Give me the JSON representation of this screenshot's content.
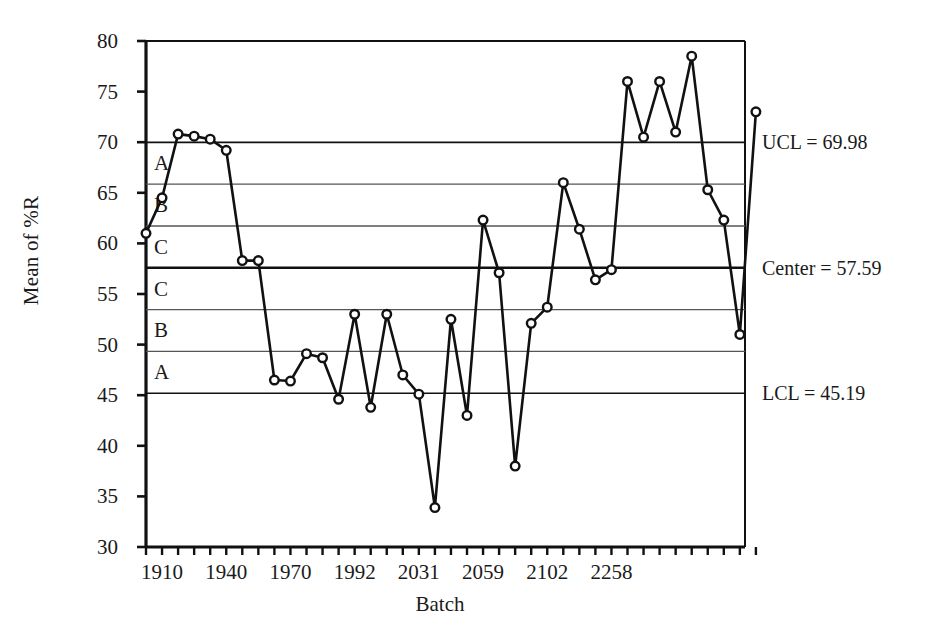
{
  "chart_data": {
    "type": "line",
    "title": "",
    "subtitle": "",
    "xlabel": "Batch",
    "ylabel": "Mean of %R",
    "ylim": [
      30,
      80
    ],
    "ytick_values": [
      30,
      35,
      40,
      45,
      50,
      55,
      60,
      65,
      70,
      75,
      80
    ],
    "ytick_labels": [
      "30",
      "35",
      "40",
      "45",
      "50",
      "55",
      "60",
      "65",
      "70",
      "75",
      "80"
    ],
    "grid": false,
    "legend": "none",
    "xtick_labels": [
      "1910",
      "1940",
      "1970",
      "1992",
      "2031",
      "2059",
      "2102",
      "2258"
    ],
    "xtick_indices": [
      1,
      5,
      9,
      13,
      17,
      21,
      25,
      29
    ],
    "n_points": 39,
    "x_index_range": [
      0,
      38
    ],
    "marker": "open-circle",
    "series": [
      {
        "name": "Mean of %R",
        "values": [
          61.0,
          64.5,
          70.8,
          70.6,
          70.3,
          69.2,
          58.3,
          58.3,
          46.5,
          46.4,
          49.1,
          48.7,
          44.6,
          53.0,
          43.8,
          53.0,
          47.0,
          45.1,
          33.9,
          52.5,
          43.0,
          62.3,
          57.1,
          38.0,
          52.1,
          53.7,
          66.0,
          61.4,
          56.4,
          57.4,
          76.0,
          70.5,
          76.0,
          71.0,
          78.5,
          65.3,
          62.3,
          51.0,
          73.0
        ]
      }
    ],
    "control_limits": {
      "ucl": 69.98,
      "center": 57.59,
      "lcl": 45.19,
      "ucl_label": "UCL = 69.98",
      "center_label": "Center = 57.59",
      "lcl_label": "LCL = 45.19",
      "sigma_lines": [
        65.85,
        61.72,
        53.46,
        49.33
      ]
    },
    "zones": [
      {
        "letter": "A",
        "value": 67.9
      },
      {
        "letter": "B",
        "value": 63.8
      },
      {
        "letter": "C",
        "value": 59.6
      },
      {
        "letter": "C",
        "value": 55.5
      },
      {
        "letter": "B",
        "value": 51.4
      },
      {
        "letter": "A",
        "value": 47.3
      }
    ],
    "colors": {
      "line": "#111111",
      "marker_fill": "#ffffff",
      "marker_stroke": "#111111",
      "axis": "#111111",
      "limit_line": "#111111",
      "sigma_line": "#555555"
    }
  }
}
